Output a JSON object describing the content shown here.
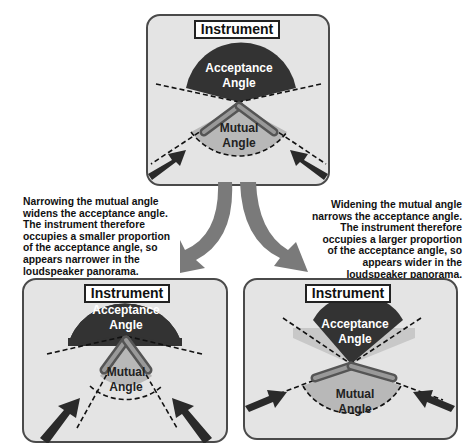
{
  "colors": {
    "background": "#ffffff",
    "panel_fill": "#e4e4e4",
    "panel_border": "#4a4a4a",
    "acceptance_fill": "#333333",
    "mutual_fill": "#b8b8b8",
    "arrow_fill": "#7a7a7a",
    "mic_arrow_fill": "#2a2a2a"
  },
  "top_panel": {
    "title": "Instrument",
    "acceptance_label_line1": "Acceptance",
    "acceptance_label_line2": "Angle",
    "mutual_label_line1": "Mutual",
    "mutual_label_line2": "Angle"
  },
  "left_panel": {
    "title": "Instrument",
    "acceptance_label_line1": "Acceptance",
    "acceptance_label_line2": "Angle",
    "mutual_label_line1": "Mutual",
    "mutual_label_line2": "Angle"
  },
  "right_panel": {
    "title": "Instrument",
    "acceptance_label_line1": "Acceptance",
    "acceptance_label_line2": "Angle",
    "mutual_label_line1": "Mutual",
    "mutual_label_line2": "Angle"
  },
  "captions": {
    "left": "Narrowing the mutual angle\nwidens the acceptance angle.\nThe instrument therefore\noccupies a smaller proportion\nof the acceptance angle, so\nappears narrower in the\nloudspeaker panorama.",
    "right": "Widening the mutual angle\nnarrows the acceptance angle.\nThe instrument therefore\noccupies a larger proportion\nof the acceptance angle, so\nappears wider in the\nloudspeaker panorama."
  }
}
